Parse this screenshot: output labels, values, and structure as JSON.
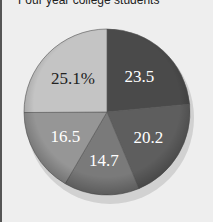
{
  "chart_data": {
    "type": "pie",
    "title": "Four year college students",
    "slices": [
      {
        "label": "23.5",
        "value": 23.5,
        "color": "#4a4a4a",
        "text_color": "#ffffff"
      },
      {
        "label": "20.2",
        "value": 20.2,
        "color": "#5e5e5e",
        "text_color": "#ffffff"
      },
      {
        "label": "14.7",
        "value": 14.7,
        "color": "#7a7a7a",
        "text_color": "#ffffff"
      },
      {
        "label": "16.5",
        "value": 16.5,
        "color": "#969696",
        "text_color": "#ffffff"
      },
      {
        "label": "25.1%",
        "value": 25.1,
        "color": "#c4c4c4",
        "text_color": "#222222"
      }
    ]
  }
}
